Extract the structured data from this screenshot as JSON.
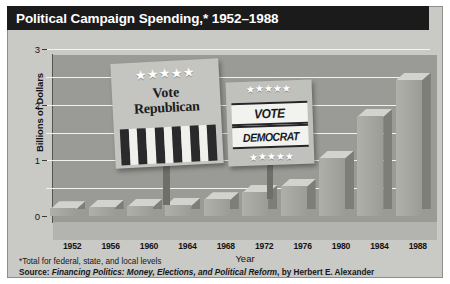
{
  "title": "Political Campaign Spending,* 1952–1988",
  "footnotes": {
    "line1": "*Total for federal, state, and local levels",
    "source_prefix": "Source: ",
    "source_title": "Financing Politics: Money, Elections, and Political Reform",
    "source_suffix": ", by Herbert E. Alexander"
  },
  "signs": {
    "republican": {
      "stars": "★★★★★",
      "line1": "Vote",
      "line2": "Republican"
    },
    "democrat": {
      "stars_top": "★★★★★",
      "stars_bottom": "★★★★★",
      "line1": "VOTE",
      "line2": "DEMOCRAT"
    }
  },
  "colors": {
    "panel": "#c9c9c5",
    "title_bar": "#1b1b1b",
    "title_text": "#ffffff",
    "plot_bg": "#9a9a96",
    "gridline": "#f2f2ee",
    "bar_front": "#a5a5a0",
    "bar_top": "#d2d2ce",
    "bar_side": "#7e7e79"
  },
  "chart_data": {
    "type": "bar",
    "title": "Political Campaign Spending,* 1952–1988",
    "xlabel": "Year",
    "ylabel": "Billions of Dollars",
    "ylim": [
      0,
      3
    ],
    "yticks": [
      0,
      1,
      2,
      3
    ],
    "ytick_labels": [
      "0",
      "1",
      "2",
      "3"
    ],
    "gridlines": [
      0.5,
      1,
      1.5,
      2,
      2.5,
      3
    ],
    "grid": true,
    "legend": "none",
    "categories": [
      "1952",
      "1956",
      "1960",
      "1964",
      "1968",
      "1972",
      "1976",
      "1980",
      "1984",
      "1988"
    ],
    "values": [
      0.14,
      0.16,
      0.18,
      0.2,
      0.3,
      0.43,
      0.54,
      1.05,
      1.8,
      2.45
    ],
    "units": "Billions of Dollars",
    "note": "*Total for federal, state, and local levels",
    "source": "Financing Politics: Money, Elections, and Political Reform, by Herbert E. Alexander"
  }
}
